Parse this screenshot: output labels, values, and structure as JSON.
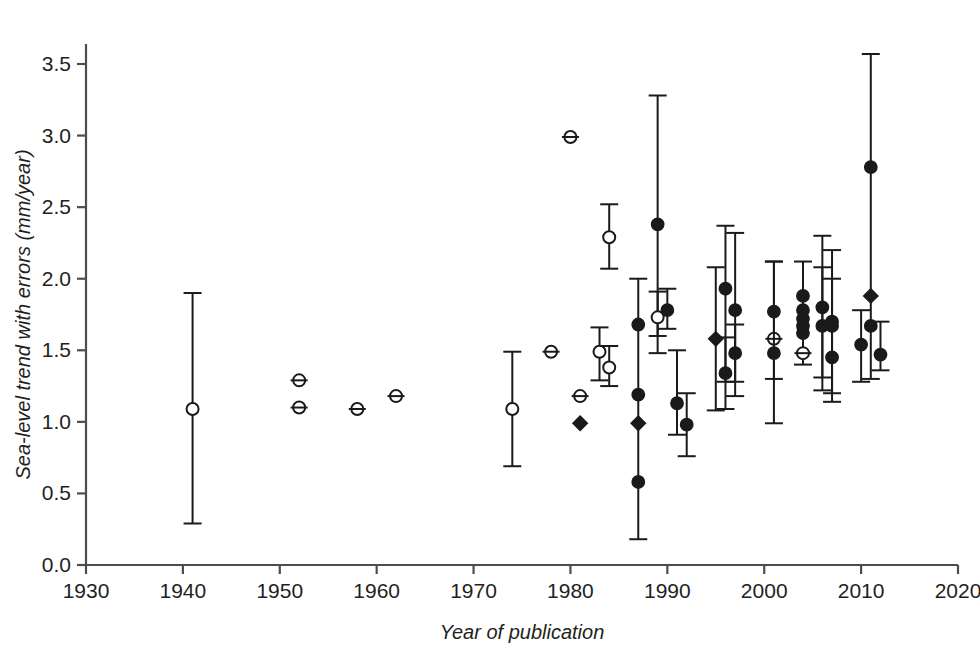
{
  "chart_data": {
    "type": "scatter",
    "title": "",
    "subtitle": "",
    "xlabel": "Year of publication",
    "ylabel": "Sea-level trend with errors (mm/year)",
    "xlim": [
      1930,
      2020
    ],
    "ylim": [
      0.0,
      3.7
    ],
    "xticks": [
      1930,
      1940,
      1950,
      1960,
      1970,
      1980,
      1990,
      2000,
      2010,
      2020
    ],
    "xtick_labels": [
      "1930",
      "1940",
      "1950",
      "1960",
      "1970",
      "1980",
      "1990",
      "2000",
      "2010",
      "2020"
    ],
    "yticks": [
      0.0,
      0.5,
      1.0,
      1.5,
      2.0,
      2.5,
      3.0,
      3.5
    ],
    "ytick_labels": [
      "0.0",
      "0.5",
      "1.0",
      "1.5",
      "2.0",
      "2.5",
      "3.0",
      "3.5"
    ],
    "grid": false,
    "legend": false,
    "legend_position": "none",
    "marker_colors": {
      "open": "#ffffff",
      "filled": "#1a1a1a",
      "outline": "#1a1a1a"
    },
    "axis_color": "#4d4d4d",
    "points": [
      {
        "x": 1941,
        "y": 1.09,
        "lo": 0.29,
        "hi": 1.9,
        "marker": "open"
      },
      {
        "x": 1952,
        "y": 1.29,
        "lo": null,
        "hi": null,
        "marker": "open"
      },
      {
        "x": 1952,
        "y": 1.1,
        "lo": null,
        "hi": null,
        "marker": "open"
      },
      {
        "x": 1958,
        "y": 1.09,
        "lo": null,
        "hi": null,
        "marker": "open"
      },
      {
        "x": 1962,
        "y": 1.18,
        "lo": null,
        "hi": null,
        "marker": "open"
      },
      {
        "x": 1974,
        "y": 1.09,
        "lo": 0.69,
        "hi": 1.49,
        "marker": "open"
      },
      {
        "x": 1978,
        "y": 1.49,
        "lo": null,
        "hi": null,
        "marker": "open"
      },
      {
        "x": 1980,
        "y": 2.99,
        "lo": null,
        "hi": null,
        "marker": "open"
      },
      {
        "x": 1981,
        "y": 1.18,
        "lo": null,
        "hi": null,
        "marker": "open"
      },
      {
        "x": 1981,
        "y": 0.99,
        "lo": null,
        "hi": null,
        "marker": "diamond"
      },
      {
        "x": 1984,
        "y": 2.29,
        "lo": 2.07,
        "hi": 2.52,
        "marker": "open"
      },
      {
        "x": 1983,
        "y": 1.49,
        "lo": 1.29,
        "hi": 1.66,
        "marker": "open"
      },
      {
        "x": 1984,
        "y": 1.38,
        "lo": 1.25,
        "hi": 1.53,
        "marker": "open"
      },
      {
        "x": 1987,
        "y": 1.68,
        "lo": 0.18,
        "hi": 2.0,
        "marker": "filled"
      },
      {
        "x": 1987,
        "y": 1.19,
        "lo": null,
        "hi": null,
        "marker": "filled"
      },
      {
        "x": 1987,
        "y": 0.99,
        "lo": null,
        "hi": null,
        "marker": "diamond"
      },
      {
        "x": 1987,
        "y": 0.58,
        "lo": null,
        "hi": null,
        "marker": "filled"
      },
      {
        "x": 1989,
        "y": 2.38,
        "lo": 1.48,
        "hi": 3.28,
        "marker": "filled"
      },
      {
        "x": 1989,
        "y": 1.73,
        "lo": 1.6,
        "hi": 1.91,
        "marker": "open"
      },
      {
        "x": 1990,
        "y": 1.78,
        "lo": 1.65,
        "hi": 1.93,
        "marker": "filled"
      },
      {
        "x": 1991,
        "y": 1.13,
        "lo": 0.91,
        "hi": 1.5,
        "marker": "filled"
      },
      {
        "x": 1992,
        "y": 0.98,
        "lo": 0.76,
        "hi": 1.2,
        "marker": "filled"
      },
      {
        "x": 1995,
        "y": 1.58,
        "lo": 1.08,
        "hi": 2.08,
        "marker": "diamond"
      },
      {
        "x": 1996,
        "y": 1.93,
        "lo": 1.28,
        "hi": 2.37,
        "marker": "filled"
      },
      {
        "x": 1996,
        "y": 1.34,
        "lo": 1.09,
        "hi": 1.59,
        "marker": "filled"
      },
      {
        "x": 1997,
        "y": 1.78,
        "lo": 1.18,
        "hi": 2.32,
        "marker": "filled"
      },
      {
        "x": 1997,
        "y": 1.48,
        "lo": 1.28,
        "hi": 1.68,
        "marker": "filled"
      },
      {
        "x": 2001,
        "y": 1.77,
        "lo": 1.3,
        "hi": 2.12,
        "marker": "filled"
      },
      {
        "x": 2001,
        "y": 1.58,
        "lo": null,
        "hi": null,
        "marker": "open"
      },
      {
        "x": 2001,
        "y": 1.48,
        "lo": 0.99,
        "hi": 2.12,
        "marker": "filled"
      },
      {
        "x": 2004,
        "y": 1.88,
        "lo": 1.4,
        "hi": 2.12,
        "marker": "filled"
      },
      {
        "x": 2004,
        "y": 1.78,
        "lo": null,
        "hi": null,
        "marker": "filled"
      },
      {
        "x": 2004,
        "y": 1.72,
        "lo": null,
        "hi": null,
        "marker": "filled"
      },
      {
        "x": 2004,
        "y": 1.67,
        "lo": null,
        "hi": null,
        "marker": "filled"
      },
      {
        "x": 2004,
        "y": 1.62,
        "lo": null,
        "hi": null,
        "marker": "filled"
      },
      {
        "x": 2004,
        "y": 1.48,
        "lo": null,
        "hi": null,
        "marker": "open"
      },
      {
        "x": 2006,
        "y": 1.8,
        "lo": 1.31,
        "hi": 2.3,
        "marker": "filled"
      },
      {
        "x": 2006,
        "y": 1.67,
        "lo": 1.22,
        "hi": 2.08,
        "marker": "filled"
      },
      {
        "x": 2007,
        "y": 1.7,
        "lo": 1.2,
        "hi": 2.2,
        "marker": "filled"
      },
      {
        "x": 2007,
        "y": 1.67,
        "lo": null,
        "hi": null,
        "marker": "filled"
      },
      {
        "x": 2007,
        "y": 1.45,
        "lo": 1.14,
        "hi": 2.0,
        "marker": "filled"
      },
      {
        "x": 2011,
        "y": 2.78,
        "lo": 1.3,
        "hi": 3.57,
        "marker": "filled"
      },
      {
        "x": 2011,
        "y": 1.88,
        "lo": null,
        "hi": null,
        "marker": "diamond"
      },
      {
        "x": 2011,
        "y": 1.67,
        "lo": null,
        "hi": null,
        "marker": "filled"
      },
      {
        "x": 2010,
        "y": 1.54,
        "lo": 1.28,
        "hi": 1.78,
        "marker": "filled"
      },
      {
        "x": 2012,
        "y": 1.47,
        "lo": 1.36,
        "hi": 1.7,
        "marker": "filled"
      }
    ]
  }
}
